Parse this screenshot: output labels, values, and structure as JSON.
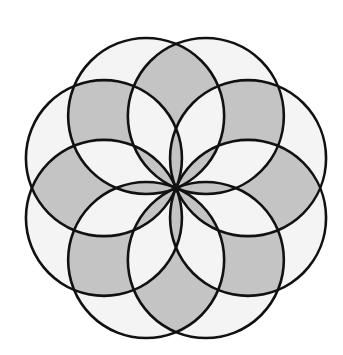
{
  "figure": {
    "circle_count": 8,
    "center": [
      176,
      188
    ],
    "radius": 78,
    "start_angle_deg": 22.5,
    "colors": {
      "background": "#ffffff",
      "light_fill": "#f4f4f4",
      "shaded_fill": "#c4c4c4",
      "stroke": "#111111"
    },
    "stroke_width": 2.6,
    "shading_rule": "regions covered by an even number of circles are shaded gray; odd are light"
  }
}
